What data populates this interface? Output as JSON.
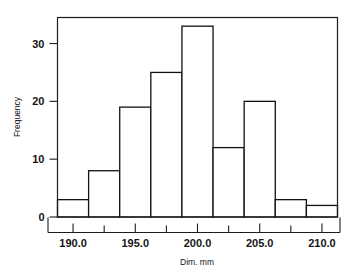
{
  "chart_data": {
    "type": "bar",
    "title": "",
    "subtitle": "",
    "xlabel": "Dim. mm",
    "ylabel": "Frequency",
    "categories": [
      "188.75-191.25",
      "191.25-193.75",
      "193.75-196.25",
      "196.25-198.75",
      "198.75-201.25",
      "201.25-203.75",
      "203.75-206.25",
      "206.25-208.75",
      "208.75-211.25"
    ],
    "bin_edges": [
      188.75,
      191.25,
      193.75,
      196.25,
      198.75,
      201.25,
      203.75,
      206.25,
      208.75,
      211.25
    ],
    "bin_width": 2.5,
    "values": [
      3,
      8,
      19,
      25,
      33,
      12,
      20,
      3,
      2
    ],
    "xlim": [
      188.75,
      211.25
    ],
    "ylim": [
      0,
      34.5
    ],
    "x_major_ticks": [
      190.0,
      195.0,
      200.0,
      205.0,
      210.0
    ],
    "x_major_tick_labels": [
      "190.0",
      "195.0",
      "200.0",
      "205.0",
      "210.0"
    ],
    "x_minor_ticks": [
      192.5,
      197.5,
      202.5,
      207.5
    ],
    "y_ticks": [
      0,
      10,
      20,
      30
    ],
    "y_tick_labels": [
      "0",
      "10",
      "20",
      "30"
    ],
    "grid": false,
    "legend": false,
    "bar_fill_color": "#ffffff",
    "bar_edge_color": "#121212",
    "axis_color": "#1c1c1c",
    "background_color": "#ffffff"
  }
}
